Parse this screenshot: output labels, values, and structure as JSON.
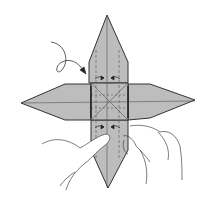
{
  "figure": {
    "type": "origami-instruction-diagram",
    "colors": {
      "paper": "#bdbdbd",
      "paper_dark": "#a8a8a8",
      "outline": "#333333",
      "hand_outline": "#444444",
      "background": "#ffffff"
    },
    "elements": {
      "arrow": "curved looping arrow pointing to upper-left edge of center square",
      "hands": "two hands pinching bottom flap",
      "center_square_crease": "X crease with cross lines",
      "small_arrows": "paired inward arrows above and below center square"
    }
  }
}
